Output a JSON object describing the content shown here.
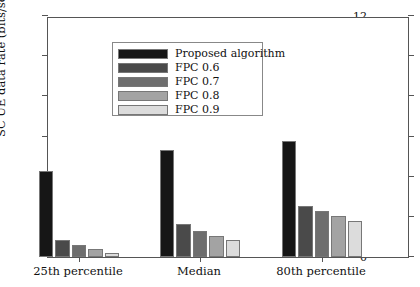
{
  "chart_data": {
    "type": "bar",
    "title": "",
    "xlabel": "",
    "ylabel": "SC UE data rate (bits/sec/Hz)",
    "categories": [
      "25th percentile",
      "Median",
      "80th percentile"
    ],
    "ylim": [
      0,
      12
    ],
    "yticks": [
      0,
      2,
      4,
      6,
      8,
      10,
      12
    ],
    "ytick_labels": [
      "0",
      "2",
      "4",
      "6",
      "8",
      "10",
      "12"
    ],
    "grid": false,
    "legend_position": "upper left",
    "series": [
      {
        "name": "Proposed algorithm",
        "color": "#161616",
        "values": [
          4.28,
          5.32,
          5.77
        ]
      },
      {
        "name": "FPC 0.6",
        "color": "#4a4a4a",
        "values": [
          0.85,
          1.64,
          2.54
        ]
      },
      {
        "name": "FPC 0.7",
        "color": "#6e6e6e",
        "values": [
          0.6,
          1.29,
          2.29
        ]
      },
      {
        "name": "FPC 0.8",
        "color": "#a3a3a3",
        "values": [
          0.38,
          1.04,
          2.04
        ]
      },
      {
        "name": "FPC 0.9",
        "color": "#dcdcdc",
        "values": [
          0.22,
          0.85,
          1.79
        ]
      }
    ]
  }
}
